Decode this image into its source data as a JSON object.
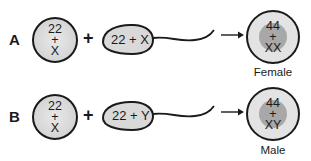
{
  "colors": {
    "outline": "#1a1a1a",
    "cell_fill": "#d9d9d9",
    "cell_fill_light": "#e6e6e6",
    "nucleus_fill": "#a9a9a9",
    "background": "#ffffff"
  },
  "rows": [
    {
      "label": "A",
      "egg": {
        "line1": "22",
        "line2": "+",
        "line3": "X"
      },
      "plus": "+",
      "sperm": {
        "text": "22 + X"
      },
      "arrow": "→",
      "zygote": {
        "line1": "44",
        "line2": "+",
        "line3": "XX"
      },
      "outcome": "Female"
    },
    {
      "label": "B",
      "egg": {
        "line1": "22",
        "line2": "+",
        "line3": "X"
      },
      "plus": "+",
      "sperm": {
        "text": "22 + Y"
      },
      "arrow": "→",
      "zygote": {
        "line1": "44",
        "line2": "+",
        "line3": "XY"
      },
      "outcome": "Male"
    }
  ]
}
